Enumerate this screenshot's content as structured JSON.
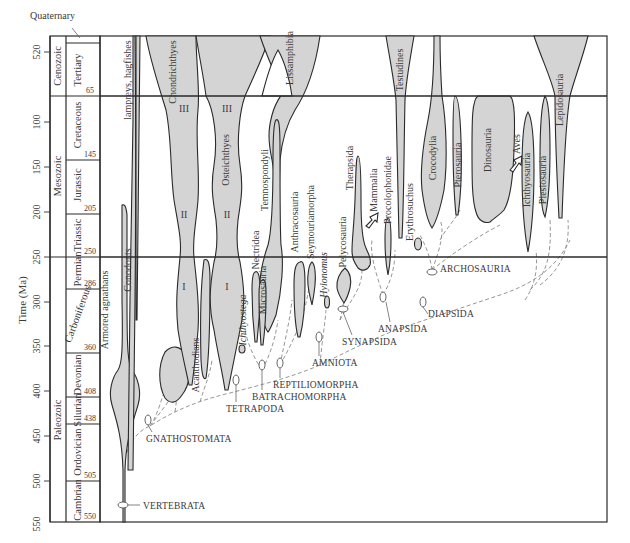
{
  "diagram": {
    "type": "spindle-phylogeny",
    "y_axis": {
      "label": "Time (Ma)",
      "ticks": [
        "520",
        "100",
        "150",
        "200",
        "250",
        "300",
        "350",
        "400",
        "450",
        "500",
        "550"
      ]
    },
    "timescale": {
      "quaternary_label": "Quaternary",
      "eras": [
        {
          "name": "Cenozoic"
        },
        {
          "name": "Mesozoic"
        },
        {
          "name": "Paleozoic"
        }
      ],
      "periods": [
        {
          "name": "Tertiary",
          "end": "65"
        },
        {
          "name": "Cretaceous",
          "end": "145"
        },
        {
          "name": "Jurassic",
          "end": "205"
        },
        {
          "name": "Triassic",
          "end": "250"
        },
        {
          "name": "Permian",
          "end": "286"
        },
        {
          "name": "Carboniferous",
          "end": "360"
        },
        {
          "name": "Devonian",
          "end": "408"
        },
        {
          "name": "Silurian",
          "end": "438"
        },
        {
          "name": "Ordovician",
          "end": "505"
        },
        {
          "name": "Cambrian",
          "end": "550"
        }
      ]
    },
    "taxa": {
      "lampreys": "lampreys, hagfishes",
      "conodonts": "Conodonts",
      "armored": "Armored agnathans",
      "chondrichthyes": "Chondrichthyes",
      "osteichthyes": "Osteichthyes",
      "acanthodians": "Acanthodians",
      "ichthyostega": "Ichthyostega",
      "nectridea": "Nectridea",
      "microsauria": "Microsauria",
      "temnospondyli": "Temnospondyli",
      "lissamphibia": "Lissamphibia",
      "anthracosauria": "Anthracosauria",
      "seymouriamorpha": "Seymouriamorpha",
      "hylonomus": "Hylonomus",
      "pelycosauria": "Pelycosauria",
      "therapsida": "Therapsida",
      "mammalia": "Mammalia",
      "procolophonidae": "Procolophonidae",
      "testudines": "Testudines",
      "erythrosuchus": "Erythrosuchus",
      "crocodylia": "Crocodylia",
      "pterosauria": "Pterosauria",
      "dinosauria": "Dinosauria",
      "aves": "Aves",
      "ichthyosauria": "Ichthyosauria",
      "plesiosauria": "Plesiosauria",
      "lepidosauria": "Lepidosauria"
    },
    "stage_marks": {
      "chond_III": "III",
      "chond_II": "II",
      "chond_I": "I",
      "oste_III": "III",
      "oste_II": "II",
      "oste_I": "I"
    },
    "clades": {
      "vertebrata": "VERTEBRATA",
      "gnathostomata": "GNATHOSTOMATA",
      "tetrapoda": "TETRAPODA",
      "batrachomorpha": "BATRACHOMORPHA",
      "reptiliomorpha": "REPTILIOMORPHA",
      "amniota": "AMNIOTA",
      "synapsida": "SYNAPSIDA",
      "anapsida": "ANAPSIDA",
      "diapsida": "DIAPSIDA",
      "archosauria": "ARCHOSAURIA"
    },
    "colors": {
      "spindle_fill": "#d4d4d4",
      "outline": "#2a2a2a",
      "dashed": "#8a8a8a",
      "background": "#ffffff"
    }
  }
}
